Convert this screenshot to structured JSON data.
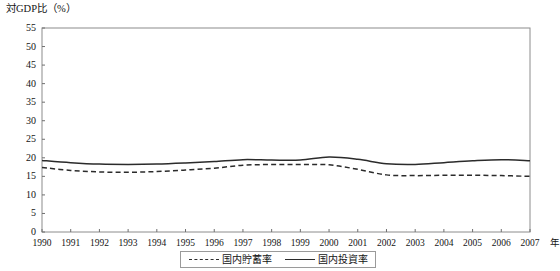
{
  "chart_data": {
    "type": "line",
    "title": "対GDP比（%）",
    "xlabel": "年",
    "ylabel": "",
    "xlim": [
      1990,
      2007
    ],
    "ylim": [
      0,
      55
    ],
    "ytick_step": 5,
    "grid": false,
    "legend_position": "bottom-center",
    "x": [
      1990,
      1991,
      1992,
      1993,
      1994,
      1995,
      1996,
      1997,
      1998,
      1999,
      2000,
      2001,
      2002,
      2003,
      2004,
      2005,
      2006,
      2007
    ],
    "categories": [
      "1990",
      "1991",
      "1992",
      "1993",
      "1994",
      "1995",
      "1996",
      "1997",
      "1998",
      "1999",
      "2000",
      "2001",
      "2002",
      "2003",
      "2004",
      "2005",
      "2006",
      "2007"
    ],
    "yticks": [
      "0",
      "5",
      "10",
      "15",
      "20",
      "25",
      "30",
      "35",
      "40",
      "45",
      "50",
      "55"
    ],
    "series": [
      {
        "name": "国内貯蓄率",
        "style": "dashed",
        "color": "#2b2b2b",
        "values": [
          17.4,
          16.6,
          16.2,
          16.1,
          16.3,
          16.7,
          17.2,
          18.0,
          18.2,
          18.2,
          18.1,
          16.9,
          15.4,
          15.2,
          15.3,
          15.3,
          15.2,
          15.0
        ]
      },
      {
        "name": "国内投資率",
        "style": "solid",
        "color": "#2b2b2b",
        "values": [
          19.3,
          18.7,
          18.3,
          18.2,
          18.3,
          18.6,
          19.0,
          19.5,
          19.4,
          19.4,
          20.2,
          19.6,
          18.4,
          18.2,
          18.7,
          19.2,
          19.5,
          19.2
        ]
      }
    ]
  },
  "legend": {
    "items": [
      {
        "label": "国内貯蓄率",
        "style": "dashed"
      },
      {
        "label": "国内投資率",
        "style": "solid"
      }
    ]
  }
}
